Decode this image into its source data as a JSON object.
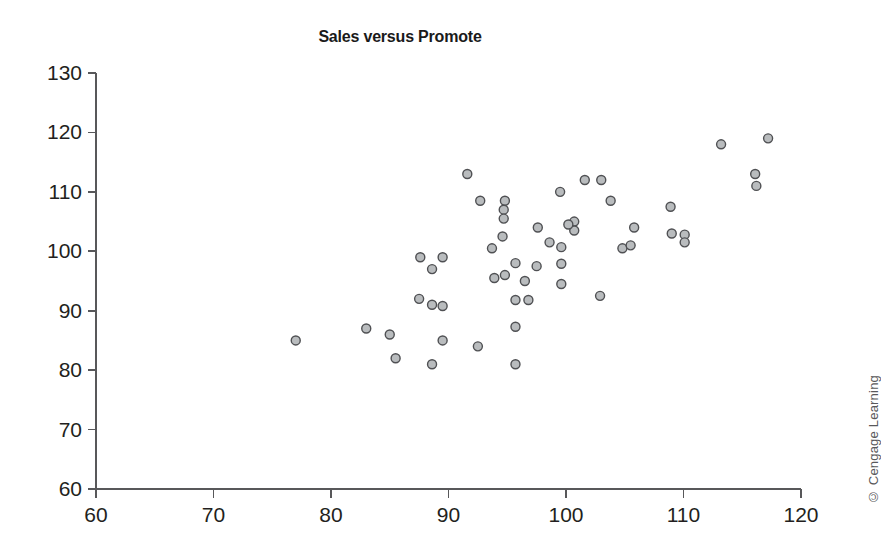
{
  "credit": "© Cengage Learning",
  "chart_data": {
    "type": "scatter",
    "title": "Sales versus Promote",
    "xlabel": "",
    "ylabel": "",
    "xlim": [
      60,
      120
    ],
    "ylim": [
      60,
      130
    ],
    "xticks": [
      60,
      70,
      80,
      90,
      100,
      110,
      120
    ],
    "yticks": [
      60,
      70,
      80,
      90,
      100,
      110,
      120,
      130
    ],
    "grid": false,
    "legend": false,
    "marker": {
      "shape": "circle",
      "fill": "#b9bcbe",
      "stroke": "#4f5053",
      "size": 9
    },
    "series": [
      {
        "name": "Sales vs Promote",
        "points": [
          [
            77.0,
            85.0
          ],
          [
            83.0,
            87.0
          ],
          [
            85.0,
            86.0
          ],
          [
            85.5,
            82.0
          ],
          [
            87.6,
            99.0
          ],
          [
            89.5,
            99.0
          ],
          [
            88.6,
            97.0
          ],
          [
            87.5,
            92.0
          ],
          [
            88.6,
            91.0
          ],
          [
            89.5,
            85.0
          ],
          [
            88.6,
            81.0
          ],
          [
            91.6,
            113.0
          ],
          [
            92.5,
            84.0
          ],
          [
            92.7,
            108.5
          ],
          [
            94.8,
            108.5
          ],
          [
            94.7,
            107.0
          ],
          [
            94.7,
            105.5
          ],
          [
            94.6,
            102.5
          ],
          [
            93.7,
            100.5
          ],
          [
            93.9,
            95.5
          ],
          [
            94.8,
            96.0
          ],
          [
            95.7,
            98.0
          ],
          [
            95.7,
            91.8
          ],
          [
            96.8,
            91.8
          ],
          [
            95.7,
            87.3
          ],
          [
            95.7,
            81.0
          ],
          [
            97.6,
            104.0
          ],
          [
            98.6,
            101.5
          ],
          [
            99.5,
            110.0
          ],
          [
            99.6,
            100.7
          ],
          [
            99.6,
            97.9
          ],
          [
            99.6,
            94.5
          ],
          [
            100.7,
            105.0
          ],
          [
            100.7,
            103.5
          ],
          [
            101.6,
            112.0
          ],
          [
            103.0,
            112.0
          ],
          [
            102.9,
            92.5
          ],
          [
            103.8,
            108.5
          ],
          [
            104.8,
            100.5
          ],
          [
            105.8,
            104.0
          ],
          [
            105.5,
            101.0
          ],
          [
            108.9,
            107.5
          ],
          [
            109.0,
            103.0
          ],
          [
            110.1,
            102.8
          ],
          [
            110.1,
            101.5
          ],
          [
            113.2,
            118.0
          ],
          [
            116.1,
            113.0
          ],
          [
            116.2,
            111.0
          ],
          [
            117.2,
            119.0
          ],
          [
            96.5,
            95.0
          ],
          [
            97.5,
            97.5
          ],
          [
            100.2,
            104.5
          ],
          [
            89.5,
            90.8
          ]
        ]
      }
    ]
  }
}
